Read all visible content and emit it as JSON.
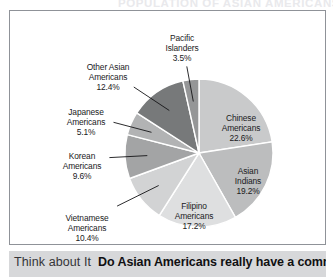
{
  "top_ghost_text": "POPULATION OF ASIAN AMERICANS",
  "caption": {
    "lead": "Think about It",
    "body": "Do Asian Americans really have a common"
  },
  "chart_data": {
    "type": "pie",
    "title": "",
    "legend_position": "labels-on-slices-and-callouts",
    "value_unit": "percent",
    "start_angle_deg": 0,
    "direction": "clockwise",
    "categories": [
      "Chinese Americans",
      "Asian Indians",
      "Filipino Americans",
      "Vietnamese Americans",
      "Korean Americans",
      "Japanese Americans",
      "Other Asian Americans",
      "Pacific Islanders"
    ],
    "values": [
      22.6,
      19.2,
      17.2,
      10.4,
      9.6,
      5.1,
      12.4,
      3.5
    ],
    "colors": [
      "#c9cacb",
      "#bcbdbe",
      "#dedfe0",
      "#d2d3d4",
      "#a3a4a5",
      "#b2b3b4",
      "#77797a",
      "#959697"
    ],
    "slices": [
      {
        "name": "Chinese Americans",
        "value": 22.6,
        "label_line1": "Chinese",
        "label_line2": "Americans",
        "label_value": "22.6%",
        "color": "#c9cacb",
        "label_placement": "inside",
        "label_x": 231,
        "label_y": 110
      },
      {
        "name": "Asian Indians",
        "value": 19.2,
        "label_line1": "Asian",
        "label_line2": "Indians",
        "label_value": "19.2%",
        "color": "#bcbdbe",
        "label_placement": "inside",
        "label_x": 238,
        "label_y": 163
      },
      {
        "name": "Filipino Americans",
        "value": 17.2,
        "label_line1": "Filipino",
        "label_line2": "Americans",
        "label_value": "17.2%",
        "color": "#dedfe0",
        "label_placement": "inside",
        "label_x": 184,
        "label_y": 198
      },
      {
        "name": "Vietnamese Americans",
        "value": 10.4,
        "label_line1": "Vietnamese",
        "label_line2": "Americans",
        "label_value": "10.4%",
        "color": "#d2d3d4",
        "label_placement": "callout",
        "label_x": 77,
        "label_y": 210
      },
      {
        "name": "Korean Americans",
        "value": 9.6,
        "label_line1": "Korean",
        "label_line2": "Americans",
        "label_value": "9.6%",
        "color": "#a3a4a5",
        "label_placement": "callout",
        "label_x": 72,
        "label_y": 148
      },
      {
        "name": "Japanese Americans",
        "value": 5.1,
        "label_line1": "Japanese",
        "label_line2": "Americans",
        "label_value": "5.1%",
        "color": "#b2b3b4",
        "label_placement": "callout",
        "label_x": 76,
        "label_y": 104
      },
      {
        "name": "Other Asian Americans",
        "value": 12.4,
        "label_line1": "Other Asian",
        "label_line2": "Americans",
        "label_value": "12.4%",
        "color": "#77797a",
        "label_placement": "callout",
        "label_x": 98,
        "label_y": 59
      },
      {
        "name": "Pacific Islanders",
        "value": 3.5,
        "label_line1": "Pacific",
        "label_line2": "Islanders",
        "label_value": "3.5%",
        "color": "#959697",
        "label_placement": "callout",
        "label_x": 172,
        "label_y": 30
      }
    ]
  }
}
